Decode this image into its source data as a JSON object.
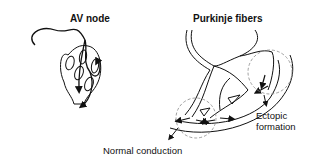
{
  "figure": {
    "panels": [
      {
        "title": "AV node"
      },
      {
        "title": "Purkinje fibers"
      }
    ],
    "annotations": {
      "normal": "Normal conduction",
      "ectopic_line1": "Ectopic",
      "ectopic_line2": "formation"
    }
  },
  "colors": {
    "ink": "#111111",
    "dashed": "#888888",
    "background": "#ffffff"
  }
}
